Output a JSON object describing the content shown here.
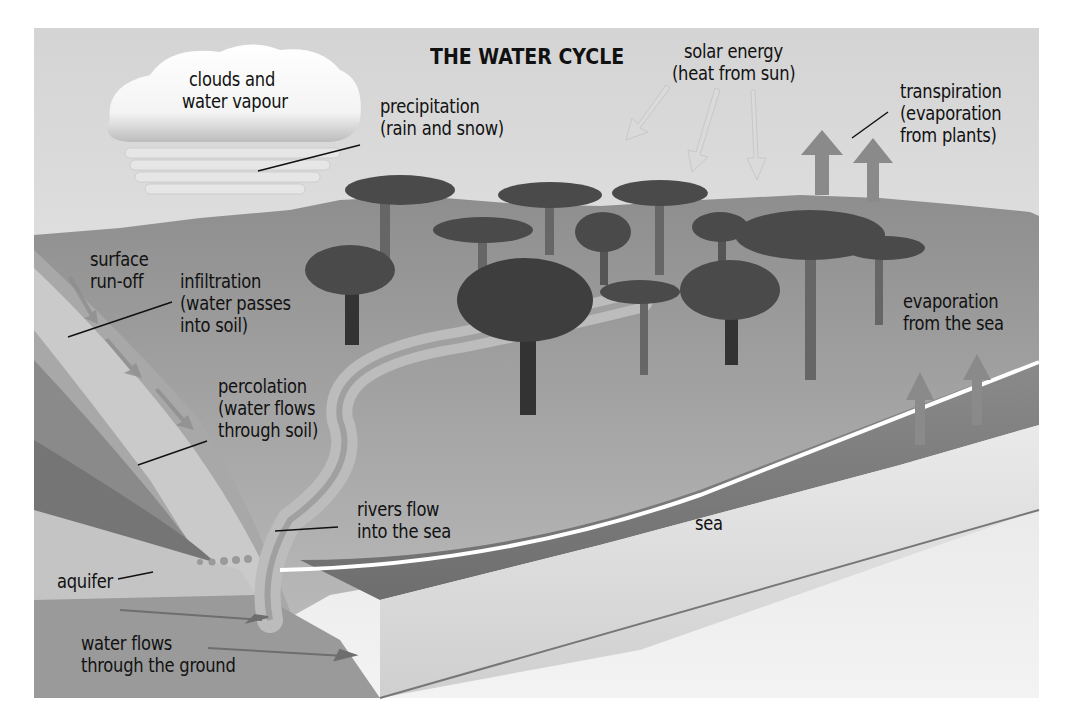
{
  "diagram": {
    "title": "THE WATER CYCLE",
    "labels": {
      "clouds": {
        "line1": "clouds and",
        "line2": "water vapour"
      },
      "precipitation": {
        "line1": "precipitation",
        "line2": "(rain and snow)"
      },
      "solar_energy": {
        "line1": "solar energy",
        "line2": "(heat from sun)"
      },
      "transpiration": {
        "line1": "transpiration",
        "line2": "(evaporation",
        "line3": "from plants)"
      },
      "surface_runoff": {
        "line1": "surface",
        "line2": "run-off"
      },
      "infiltration": {
        "line1": "infiltration",
        "line2": "(water passes",
        "line3": "into soil)"
      },
      "percolation": {
        "line1": "percolation",
        "line2": "(water flows",
        "line3": "through soil)"
      },
      "evaporation_sea": {
        "line1": "evaporation",
        "line2": "from the sea"
      },
      "rivers": {
        "line1": "rivers flow",
        "line2": "into the sea"
      },
      "sea": "sea",
      "aquifer": "aquifer",
      "groundwater": {
        "line1": "water flows",
        "line2": "through the ground"
      }
    },
    "colors": {
      "sky_top": "#d6d6d6",
      "sky_bottom": "#f4f4f4",
      "land": "#9c9c9c",
      "sea": "#7e7e7e",
      "tree_canopy": "#4a4a4a",
      "tree_trunk": "#5a5a5a",
      "solar_arrow": "#dcdcdc",
      "evap_arrow": "#8a8a8a"
    }
  }
}
